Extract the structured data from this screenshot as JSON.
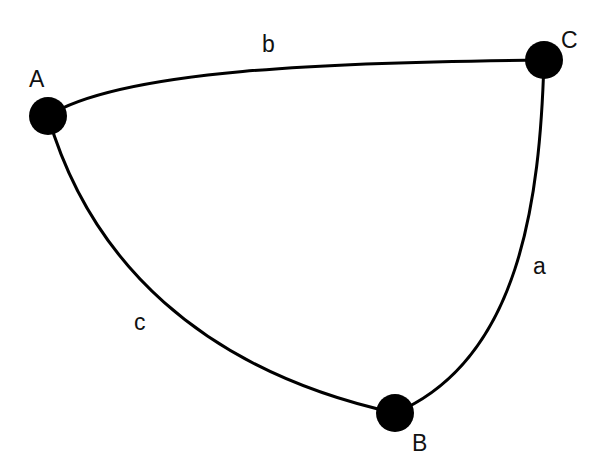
{
  "vertices": [
    {
      "id": "A",
      "label": "A"
    },
    {
      "id": "B",
      "label": "B"
    },
    {
      "id": "C",
      "label": "C"
    }
  ],
  "edges": [
    {
      "id": "b",
      "label": "b",
      "from": "A",
      "to": "C"
    },
    {
      "id": "a",
      "label": "a",
      "from": "C",
      "to": "B"
    },
    {
      "id": "c",
      "label": "c",
      "from": "A",
      "to": "B"
    }
  ],
  "colors": {
    "stroke": "#000000",
    "background": "#ffffff"
  }
}
